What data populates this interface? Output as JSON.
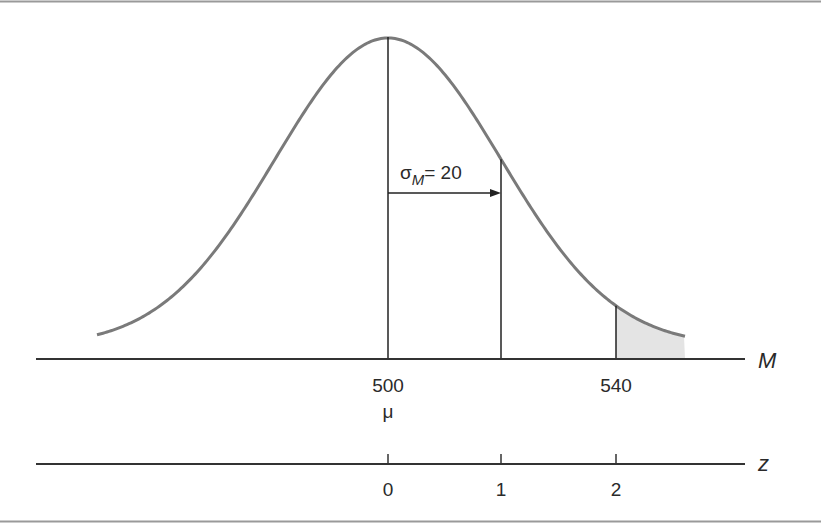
{
  "diagram": {
    "type": "normal-distribution-of-sample-means",
    "distribution": {
      "mean_label": "μ",
      "mean_value": "500",
      "sd_label": "σ",
      "sd_subscript": "M",
      "sd_equals": "= 20",
      "curve_color": "#7a7a7a",
      "shade_color": "#e4e4e4"
    },
    "m_axis": {
      "label": "M",
      "ticks": [
        {
          "value": "500",
          "position": 388
        },
        {
          "value": "540",
          "position": 616
        }
      ]
    },
    "z_axis": {
      "label": "z",
      "ticks": [
        {
          "value": "0",
          "position": 388
        },
        {
          "value": "1",
          "position": 501
        },
        {
          "value": "2",
          "position": 616
        }
      ]
    },
    "shaded_region": {
      "from": "540",
      "description": "upper tail beyond M = 540 (z = 2)"
    }
  }
}
